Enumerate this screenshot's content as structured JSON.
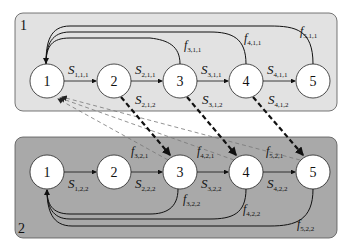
{
  "panels": [
    {
      "id": "1",
      "label": "1",
      "fill": "#e2e2e2",
      "nodes": [
        "1",
        "2",
        "3",
        "4",
        "5"
      ],
      "forward_edges": [
        {
          "from": "1",
          "to": "2",
          "label": "S",
          "sub": "1,1,1"
        },
        {
          "from": "2",
          "to": "3",
          "label": "S",
          "sub": "2,1,1"
        },
        {
          "from": "3",
          "to": "4",
          "label": "S",
          "sub": "3,1,1"
        },
        {
          "from": "4",
          "to": "5",
          "label": "S",
          "sub": "4,1,1"
        }
      ],
      "return_edges": [
        {
          "from": "3",
          "to": "1",
          "label": "f",
          "sub": "3,1,1"
        },
        {
          "from": "4",
          "to": "1",
          "label": "f",
          "sub": "4,1,1"
        },
        {
          "from": "5",
          "to": "1",
          "label": "f",
          "sub": "5,1,1"
        }
      ]
    },
    {
      "id": "2",
      "label": "2",
      "fill": "#a9a9a9",
      "nodes": [
        "1",
        "2",
        "3",
        "4",
        "5"
      ],
      "forward_edges": [
        {
          "from": "1",
          "to": "2",
          "label": "S",
          "sub": "1,2,2"
        },
        {
          "from": "2",
          "to": "3",
          "label": "S",
          "sub": "2,2,2"
        },
        {
          "from": "3",
          "to": "4",
          "label": "S",
          "sub": "3,2,2"
        },
        {
          "from": "4",
          "to": "5",
          "label": "S",
          "sub": "4,2,2"
        }
      ],
      "return_edges": [
        {
          "from": "3",
          "to": "1",
          "label": "f",
          "sub": "3,2,2"
        },
        {
          "from": "4",
          "to": "1",
          "label": "f",
          "sub": "4,2,2"
        },
        {
          "from": "5",
          "to": "1",
          "label": "f",
          "sub": "5,2,2"
        }
      ]
    }
  ],
  "cross_edges_1_to_2": [
    {
      "from": "1.2",
      "to": "2.3",
      "label": "S",
      "sub": "2,1,2",
      "style": "bold-dashed"
    },
    {
      "from": "1.3",
      "to": "2.4",
      "label": "S",
      "sub": "3,1,2",
      "style": "bold-dashed"
    },
    {
      "from": "1.4",
      "to": "2.5",
      "label": "S",
      "sub": "4,1,2",
      "style": "bold-dashed"
    }
  ],
  "cross_edges_2_to_1": [
    {
      "from": "2.3",
      "to": "1.1",
      "label": "f",
      "sub": "3,2,1",
      "style": "thin-dashed"
    },
    {
      "from": "2.4",
      "to": "1.1",
      "label": "f",
      "sub": "4,2,1",
      "style": "thin-dashed"
    },
    {
      "from": "2.5",
      "to": "1.1",
      "label": "f",
      "sub": "5,2,1",
      "style": "thin-dashed"
    }
  ],
  "colors": {
    "node_fill": "#ffffff",
    "stroke": "#222222",
    "thin_dash": "#777777"
  }
}
